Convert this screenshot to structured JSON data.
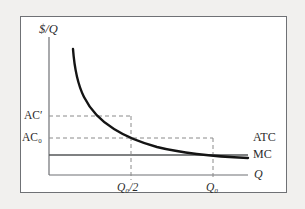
{
  "figure": {
    "name": "average-total-cost-and-marginal-cost-diagram",
    "background_color": "#f1f0ee",
    "panel_color": "#ffffff",
    "panel_border_color": "#6f7175",
    "curve_color": "#1a1a1a",
    "axis_color": "#6f7175",
    "dashed_color": "#8a8a8a",
    "text_color": "#2b2b2b"
  },
  "axes": {
    "y_axis_title": "$/Q",
    "x_axis_title": "Q"
  },
  "curve_labels": {
    "atc": "ATC",
    "mc": "MC"
  },
  "y_ticks": [
    {
      "id": "ac-prime",
      "text_main": "AC",
      "text_sup": "′",
      "value_label": "AC′"
    },
    {
      "id": "ac-zero",
      "text_main": "AC",
      "text_sub": "0",
      "value_label": "AC₀"
    }
  ],
  "x_ticks": [
    {
      "id": "q0-half",
      "text_main": "Q",
      "text_sub": "0",
      "text_tail": "/2",
      "value_label": "Q₀/2"
    },
    {
      "id": "q0",
      "text_main": "Q",
      "text_sub": "0",
      "text_tail": "",
      "value_label": "Q₀"
    }
  ],
  "chart_data": {
    "type": "line",
    "title": "",
    "xlabel": "Q",
    "ylabel": "$/Q",
    "grid": false,
    "legend": "inline-right-of-curve",
    "xlim": [
      0,
      1
    ],
    "ylim": [
      0,
      1
    ],
    "annotations": [
      {
        "text": "ATC",
        "x": 1.0,
        "y": 0.26
      },
      {
        "text": "MC",
        "x": 1.0,
        "y": 0.145
      },
      {
        "text": "Q",
        "x": 1.0,
        "y": 0.0
      },
      {
        "text": "AC′",
        "x": 0.0,
        "y": 0.43
      },
      {
        "text": "AC₀",
        "x": 0.0,
        "y": 0.27
      },
      {
        "text": "Q₀/2",
        "x": 0.41,
        "y": 0.0
      },
      {
        "text": "Q₀",
        "x": 0.82,
        "y": 0.0
      }
    ],
    "series": [
      {
        "name": "ATC",
        "type": "curve",
        "description": "downward-sloping average total cost curve asymptotic to MC",
        "x": [
          0.12,
          0.15,
          0.19,
          0.24,
          0.3,
          0.36,
          0.41,
          0.5,
          0.6,
          0.7,
          0.82,
          0.92,
          1.0
        ],
        "y": [
          0.92,
          0.8,
          0.7,
          0.61,
          0.53,
          0.47,
          0.43,
          0.37,
          0.33,
          0.3,
          0.27,
          0.26,
          0.255
        ]
      },
      {
        "name": "MC",
        "type": "horizontal-line",
        "description": "constant marginal cost",
        "x": [
          0.0,
          1.0
        ],
        "y": [
          0.145,
          0.145
        ]
      }
    ],
    "reference_lines": [
      {
        "name": "AC-prime-horizontal",
        "orientation": "horizontal",
        "y": 0.43,
        "x_from": 0.0,
        "x_to": 0.41,
        "style": "dashed"
      },
      {
        "name": "AC-zero-horizontal",
        "orientation": "horizontal",
        "y": 0.27,
        "x_from": 0.0,
        "x_to": 0.82,
        "style": "dashed"
      },
      {
        "name": "Q0-half-vertical",
        "orientation": "vertical",
        "x": 0.41,
        "y_from": 0.0,
        "y_to": 0.43,
        "style": "dashed"
      },
      {
        "name": "Q0-vertical",
        "orientation": "vertical",
        "x": 0.82,
        "y_from": 0.0,
        "y_to": 0.27,
        "style": "dashed"
      }
    ]
  }
}
